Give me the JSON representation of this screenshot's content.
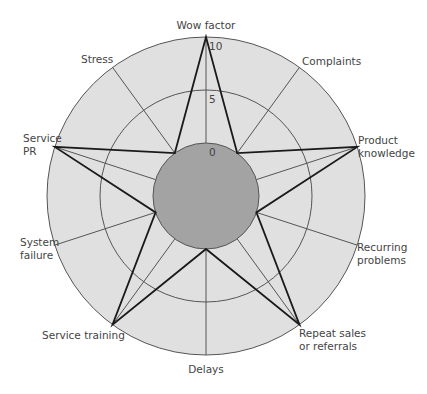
{
  "chart_data": {
    "type": "radar",
    "title": "",
    "axes": [
      "Wow factor",
      "Complaints",
      "Product knowledge",
      "Recurring problems",
      "Repeat sales or referrals",
      "Delays",
      "Service training",
      "System failure",
      "Service PR",
      "Stress"
    ],
    "values": [
      10,
      0,
      10,
      0,
      10,
      0,
      10,
      0,
      10,
      0
    ],
    "rlim": [
      0,
      10
    ],
    "ticks": [
      0,
      5,
      10
    ],
    "tick_labels": [
      "0",
      "5",
      "10"
    ],
    "grid": true,
    "colors": {
      "outer_fill": "#e0e0e0",
      "inner_fill": "#a3a3a3",
      "grid_line": "#555555",
      "series_line": "#1a1a1a",
      "text": "#444444"
    }
  },
  "labels": [
    {
      "lines": [
        "Wow factor"
      ],
      "x": 206,
      "y": 29,
      "anchor": "middle"
    },
    {
      "lines": [
        "Complaints"
      ],
      "x": 302,
      "y": 65,
      "anchor": "start"
    },
    {
      "lines": [
        "Product",
        "knowledge"
      ],
      "x": 358,
      "y": 144,
      "anchor": "start"
    },
    {
      "lines": [
        "Recurring",
        "problems"
      ],
      "x": 357,
      "y": 251,
      "anchor": "start"
    },
    {
      "lines": [
        "Repeat sales",
        "or referrals"
      ],
      "x": 299,
      "y": 337,
      "anchor": "start"
    },
    {
      "lines": [
        "Delays"
      ],
      "x": 206,
      "y": 373,
      "anchor": "middle"
    },
    {
      "lines": [
        "Service training"
      ],
      "x": 42,
      "y": 339,
      "anchor": "start"
    },
    {
      "lines": [
        "System",
        "failure"
      ],
      "x": 20,
      "y": 246,
      "anchor": "start"
    },
    {
      "lines": [
        "Service",
        "PR"
      ],
      "x": 23,
      "y": 142,
      "anchor": "start"
    },
    {
      "lines": [
        "Stress"
      ],
      "x": 81,
      "y": 63,
      "anchor": "start"
    }
  ]
}
